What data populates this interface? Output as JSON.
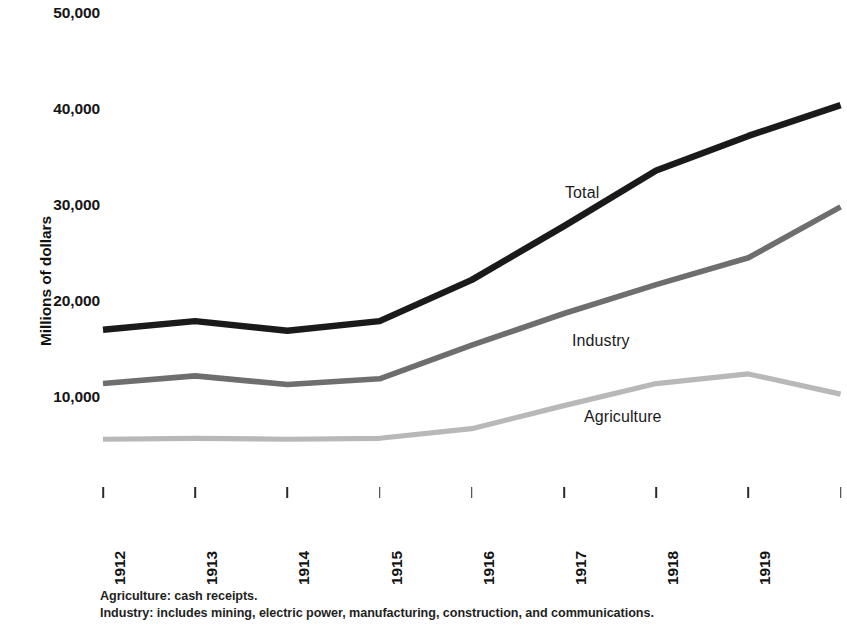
{
  "chart_data": {
    "type": "line",
    "title": "",
    "subtitle": "",
    "xlabel": "",
    "ylabel": "Millions of dollars",
    "x": [
      "1912",
      "1913",
      "1914",
      "1915",
      "1916",
      "1917",
      "1918",
      "1919",
      "1920"
    ],
    "categories": [
      "1912",
      "1913",
      "1914",
      "1915",
      "1916",
      "1917",
      "1918",
      "1919",
      "1920"
    ],
    "xlim": [
      1912,
      1920
    ],
    "ylim": [
      0,
      50000
    ],
    "y_ticks": [
      10000,
      20000,
      30000,
      40000,
      50000
    ],
    "y_tick_labels": [
      "10,000",
      "20,000",
      "30,000",
      "40,000",
      "50,000"
    ],
    "grid": false,
    "legend_position": "inline-right-of-line",
    "series": [
      {
        "name": "Total",
        "color": "#1a1a1a",
        "values": [
          17000,
          17900,
          16900,
          17900,
          22200,
          27800,
          33600,
          37200,
          40400
        ]
      },
      {
        "name": "Industry",
        "color": "#6e6e6e",
        "values": [
          11400,
          12200,
          11300,
          11900,
          15400,
          18700,
          21700,
          24500,
          29800
        ]
      },
      {
        "name": "Agriculture",
        "color": "#b8b8b8",
        "values": [
          5600,
          5700,
          5600,
          5700,
          6700,
          9100,
          11400,
          12400,
          10300
        ]
      }
    ],
    "annotations": [
      {
        "text": "Total",
        "series": "Total"
      },
      {
        "text": "Industry",
        "series": "Industry"
      },
      {
        "text": "Agriculture",
        "series": "Agriculture"
      }
    ],
    "footnotes": [
      "Agriculture: cash receipts.",
      "Industry: includes mining, electric power, manufacturing, construction, and communications."
    ]
  }
}
